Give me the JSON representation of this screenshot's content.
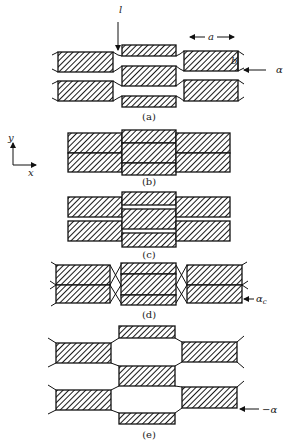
{
  "figure": {
    "hatch_color": "#1a1a1a",
    "line_color": "#111111",
    "background": "#ffffff",
    "axes": {
      "y_label": "y",
      "x_label": "x"
    },
    "panels": [
      {
        "id": "a",
        "caption": "(a)",
        "caption_pos": [
          149,
          120
        ],
        "blocks": [
          [
            58,
            52,
            55,
            20
          ],
          [
            58,
            81,
            55,
            20
          ],
          [
            122,
            45,
            54,
            11
          ],
          [
            122,
            66,
            54,
            20
          ],
          [
            122,
            96,
            54,
            11
          ],
          [
            184,
            51,
            54,
            20
          ],
          [
            184,
            80,
            54,
            21
          ]
        ],
        "edges": [
          [
            [
              113,
              52
            ],
            [
              118,
              55
            ],
            [
              122,
              56
            ]
          ],
          [
            [
              113,
              72
            ],
            [
              118,
              69
            ],
            [
              122,
              66
            ]
          ],
          [
            [
              113,
              81
            ],
            [
              118,
              84
            ],
            [
              122,
              86
            ]
          ],
          [
            [
              113,
              101
            ],
            [
              118,
              98
            ],
            [
              122,
              96
            ]
          ],
          [
            [
              176,
              56
            ],
            [
              180,
              54
            ],
            [
              184,
              51
            ]
          ],
          [
            [
              176,
              66
            ],
            [
              180,
              69
            ],
            [
              184,
              71
            ]
          ],
          [
            [
              176,
              86
            ],
            [
              180,
              83
            ],
            [
              184,
              80
            ]
          ],
          [
            [
              176,
              96
            ],
            [
              180,
              98
            ],
            [
              184,
              101
            ]
          ],
          [
            [
              58,
              52
            ],
            [
              52,
              55
            ]
          ],
          [
            [
              58,
              72
            ],
            [
              52,
              69
            ]
          ],
          [
            [
              58,
              81
            ],
            [
              52,
              84
            ]
          ],
          [
            [
              58,
              101
            ],
            [
              52,
              98
            ]
          ],
          [
            [
              238,
              51
            ],
            [
              244,
              55
            ]
          ],
          [
            [
              238,
              71
            ],
            [
              244,
              68
            ]
          ],
          [
            [
              238,
              80
            ],
            [
              244,
              84
            ]
          ],
          [
            [
              238,
              101
            ],
            [
              244,
              97
            ]
          ]
        ],
        "annotations": {
          "l_label": "l",
          "l_pos": [
            119,
            13
          ],
          "l_arrow": [
            [
              118,
              22
            ],
            [
              118,
              50
            ]
          ],
          "a_label": "a",
          "a_pos": [
            211,
            40
          ],
          "a_arrow_left": [
            [
              205,
              37
            ],
            [
              190,
              37
            ]
          ],
          "a_arrow_right": [
            [
              217,
              37
            ],
            [
              234,
              37
            ]
          ],
          "b_label": "b",
          "b_pos": [
            231,
            64
          ],
          "alpha_label": "α",
          "alpha_pos": [
            276,
            73
          ],
          "alpha_arrow": [
            [
              266,
              70
            ],
            [
              244,
              70
            ]
          ]
        }
      },
      {
        "id": "b",
        "caption": "(b)",
        "caption_pos": [
          149,
          185
        ],
        "blocks": [
          [
            68,
            133,
            54,
            20
          ],
          [
            68,
            153,
            54,
            19
          ],
          [
            122,
            130,
            54,
            13
          ],
          [
            122,
            143,
            54,
            20
          ],
          [
            122,
            163,
            54,
            12
          ],
          [
            176,
            133,
            54,
            20
          ],
          [
            176,
            153,
            54,
            19
          ]
        ],
        "edges": []
      },
      {
        "id": "c",
        "caption": "(c)",
        "caption_pos": [
          149,
          258
        ],
        "blocks": [
          [
            68,
            197,
            54,
            20
          ],
          [
            68,
            221,
            54,
            20
          ],
          [
            122,
            192,
            54,
            13
          ],
          [
            122,
            209,
            54,
            20
          ],
          [
            122,
            233,
            54,
            14
          ],
          [
            176,
            197,
            54,
            20
          ],
          [
            176,
            221,
            54,
            20
          ]
        ],
        "edges": []
      },
      {
        "id": "d",
        "caption": "(d)",
        "caption_pos": [
          149,
          318
        ],
        "blocks": [
          [
            56,
            265,
            54,
            20
          ],
          [
            56,
            285,
            54,
            18
          ],
          [
            121,
            263,
            55,
            11
          ],
          [
            121,
            274,
            55,
            21
          ],
          [
            121,
            295,
            55,
            10
          ],
          [
            187,
            265,
            55,
            20
          ],
          [
            187,
            285,
            55,
            18
          ]
        ],
        "edges": [
          [
            [
              110,
              265
            ],
            [
              121,
              285
            ]
          ],
          [
            [
              110,
              285
            ],
            [
              121,
              265
            ]
          ],
          [
            [
              110,
              285
            ],
            [
              121,
              303
            ]
          ],
          [
            [
              110,
              303
            ],
            [
              121,
              285
            ]
          ],
          [
            [
              176,
              265
            ],
            [
              187,
              285
            ]
          ],
          [
            [
              176,
              285
            ],
            [
              187,
              265
            ]
          ],
          [
            [
              176,
              285
            ],
            [
              187,
              303
            ]
          ],
          [
            [
              176,
              303
            ],
            [
              187,
              285
            ]
          ],
          [
            [
              56,
              265
            ],
            [
              51,
              262
            ]
          ],
          [
            [
              56,
              285
            ],
            [
              50,
              281
            ]
          ],
          [
            [
              56,
              285
            ],
            [
              50,
              289
            ]
          ],
          [
            [
              56,
              303
            ],
            [
              51,
              306
            ]
          ],
          [
            [
              242,
              265
            ],
            [
              247,
              262
            ]
          ],
          [
            [
              242,
              285
            ],
            [
              248,
              281
            ]
          ],
          [
            [
              242,
              285
            ],
            [
              248,
              289
            ]
          ]
        ],
        "annotations": {
          "alphac_label": "α",
          "alphac_sub": "c",
          "alphac_pos": [
            256,
            302
          ],
          "alphac_arrow": [
            [
              254,
              299
            ],
            [
              244,
              299
            ]
          ]
        }
      },
      {
        "id": "e",
        "caption": "(e)",
        "caption_pos": [
          149,
          438
        ],
        "blocks": [
          [
            56,
            343,
            55,
            20
          ],
          [
            56,
            390,
            55,
            20
          ],
          [
            119,
            326,
            56,
            12
          ],
          [
            119,
            366,
            56,
            20
          ],
          [
            119,
            413,
            56,
            11
          ],
          [
            182,
            342,
            55,
            20
          ],
          [
            182,
            387,
            55,
            21
          ]
        ],
        "edges": [
          [
            [
              111,
              343
            ],
            [
              119,
              338
            ]
          ],
          [
            [
              111,
              363
            ],
            [
              119,
              366
            ]
          ],
          [
            [
              111,
              390
            ],
            [
              119,
              386
            ]
          ],
          [
            [
              111,
              410
            ],
            [
              119,
              413
            ]
          ],
          [
            [
              175,
              338
            ],
            [
              182,
              342
            ]
          ],
          [
            [
              175,
              366
            ],
            [
              182,
              362
            ]
          ],
          [
            [
              175,
              386
            ],
            [
              182,
              387
            ]
          ],
          [
            [
              175,
              413
            ],
            [
              182,
              408
            ]
          ],
          [
            [
              56,
              343
            ],
            [
              48,
              338
            ]
          ],
          [
            [
              56,
              363
            ],
            [
              48,
              367
            ]
          ],
          [
            [
              56,
              390
            ],
            [
              48,
              385
            ]
          ],
          [
            [
              56,
              410
            ],
            [
              48,
              414
            ]
          ],
          [
            [
              237,
              342
            ],
            [
              244,
              336
            ]
          ],
          [
            [
              237,
              362
            ],
            [
              244,
              368
            ]
          ],
          [
            [
              237,
              387
            ],
            [
              244,
              381
            ]
          ]
        ],
        "annotations": {
          "neg_alpha_label": "−α",
          "neg_alpha_pos": [
            262,
            413
          ],
          "neg_alpha_arrow": [
            [
              259,
              409
            ],
            [
              240,
              409
            ]
          ]
        }
      }
    ]
  }
}
